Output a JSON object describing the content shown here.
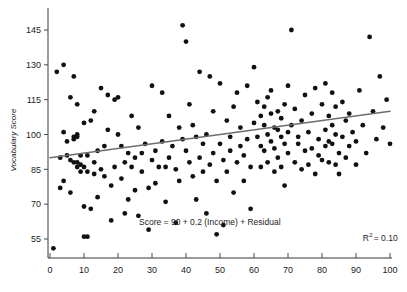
{
  "chart_data": {
    "type": "scatter",
    "title": "",
    "xlabel": "",
    "ylabel": "Vocabulary Score",
    "xlim": [
      -3,
      103
    ],
    "ylim": [
      48,
      152
    ],
    "xticks": [
      0,
      10,
      20,
      30,
      40,
      50,
      60,
      70,
      80,
      90,
      100
    ],
    "xtick_labels": [
      "0",
      "10",
      "20",
      "30",
      "40",
      "50",
      "60",
      "70",
      "80",
      "90",
      "100"
    ],
    "yticks": [
      55,
      70,
      85,
      100,
      115,
      130,
      145
    ],
    "ytick_labels": [
      "55",
      "70",
      "85",
      "100",
      "115",
      "130",
      "145"
    ],
    "grid": false,
    "legend": null,
    "marker_color": "#111111",
    "marker_size": 2.4,
    "annotations": [
      {
        "name": "equation",
        "text": "Score = 90 + 0.2 (Income) + Residual",
        "x": 47,
        "y": 61
      },
      {
        "name": "r-squared",
        "text_prefix": "R",
        "text_sup": "2",
        "text_suffix": "= 0.10",
        "x": 92,
        "y": 54
      }
    ],
    "fit_line": {
      "name": "regression-line",
      "color": "#6e6e6e",
      "intercept": 90,
      "slope": 0.2,
      "x_start": 0,
      "x_end": 100,
      "y_start": 90,
      "y_end": 110
    },
    "x": [
      1,
      2,
      3,
      3,
      4,
      4,
      4,
      5,
      5,
      6,
      6,
      6,
      7,
      7,
      7,
      7,
      8,
      8,
      8,
      8,
      8,
      9,
      9,
      9,
      10,
      10,
      10,
      10,
      11,
      11,
      11,
      12,
      12,
      13,
      13,
      13,
      14,
      14,
      15,
      15,
      16,
      16,
      17,
      17,
      18,
      18,
      19,
      19,
      20,
      20,
      21,
      21,
      22,
      22,
      23,
      23,
      24,
      24,
      25,
      25,
      26,
      26,
      27,
      27,
      28,
      29,
      29,
      30,
      30,
      31,
      31,
      32,
      33,
      33,
      34,
      34,
      35,
      35,
      36,
      37,
      37,
      38,
      38,
      39,
      39,
      40,
      40,
      41,
      41,
      42,
      42,
      43,
      43,
      44,
      44,
      45,
      45,
      46,
      46,
      47,
      47,
      48,
      48,
      49,
      49,
      50,
      50,
      51,
      51,
      52,
      52,
      53,
      53,
      54,
      54,
      55,
      55,
      56,
      56,
      57,
      57,
      58,
      58,
      59,
      59,
      60,
      60,
      61,
      61,
      62,
      62,
      62,
      63,
      63,
      63,
      64,
      64,
      64,
      65,
      65,
      65,
      66,
      66,
      66,
      67,
      67,
      67,
      68,
      68,
      68,
      69,
      69,
      69,
      70,
      70,
      70,
      71,
      71,
      72,
      72,
      73,
      73,
      74,
      74,
      75,
      75,
      76,
      76,
      77,
      77,
      78,
      78,
      79,
      79,
      80,
      80,
      81,
      81,
      81,
      82,
      82,
      82,
      83,
      83,
      83,
      84,
      84,
      84,
      85,
      85,
      86,
      86,
      87,
      87,
      88,
      88,
      89,
      90,
      90,
      91,
      92,
      93,
      94,
      95,
      96,
      97,
      98,
      99,
      100
    ],
    "y": [
      51,
      127,
      90,
      77,
      130,
      101,
      80,
      91,
      97,
      89,
      75,
      116,
      125,
      99,
      98,
      88,
      113,
      100,
      99,
      88,
      86,
      87,
      91,
      84,
      105,
      86,
      69,
      56,
      91,
      84,
      56,
      106,
      68,
      110,
      88,
      83,
      93,
      73,
      120,
      85,
      95,
      82,
      117,
      102,
      78,
      63,
      115,
      86,
      116,
      100,
      95,
      81,
      88,
      66,
      92,
      72,
      86,
      108,
      90,
      76,
      103,
      65,
      92,
      84,
      96,
      77,
      59,
      121,
      89,
      93,
      79,
      86,
      118,
      97,
      86,
      71,
      108,
      90,
      95,
      85,
      62,
      103,
      80,
      147,
      98,
      140,
      93,
      113,
      88,
      104,
      82,
      99,
      72,
      127,
      90,
      96,
      84,
      100,
      66,
      125,
      87,
      92,
      110,
      80,
      57,
      122,
      96,
      89,
      61,
      106,
      84,
      99,
      93,
      112,
      75,
      118,
      88,
      103,
      95,
      91,
      80,
      121,
      98,
      86,
      68,
      129,
      105,
      114,
      99,
      108,
      95,
      86,
      112,
      104,
      93,
      116,
      100,
      88,
      119,
      109,
      97,
      103,
      94,
      84,
      110,
      102,
      90,
      107,
      99,
      86,
      113,
      96,
      78,
      121,
      101,
      92,
      145,
      104,
      88,
      111,
      96,
      99,
      85,
      106,
      93,
      117,
      87,
      101,
      94,
      109,
      83,
      120,
      98,
      91,
      113,
      89,
      102,
      95,
      122,
      108,
      97,
      88,
      118,
      104,
      96,
      87,
      112,
      100,
      92,
      83,
      114,
      99,
      106,
      90,
      109,
      95,
      101,
      87,
      97,
      119,
      104,
      92,
      142,
      110,
      98,
      125,
      103,
      115,
      96,
      120,
      108
    ]
  }
}
